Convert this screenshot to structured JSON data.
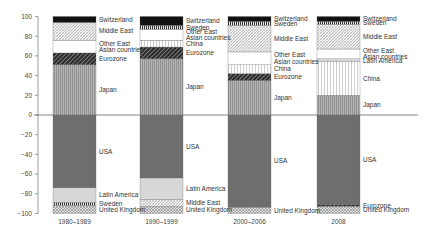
{
  "chart_data": {
    "type": "bar",
    "stacked": true,
    "title": "",
    "xlabel": "",
    "ylabel": "",
    "ylim": [
      -100,
      100
    ],
    "yticks": [
      100,
      80,
      60,
      40,
      20,
      0,
      -20,
      -40,
      -60,
      -80,
      -100
    ],
    "grid": false,
    "legend_position": "inline labels to right of each bar",
    "categories": [
      "1980–1989",
      "1990–1999",
      "2000–2006",
      "2008"
    ],
    "bars": [
      {
        "category": "1980–1989",
        "positive": [
          {
            "name": "Japan",
            "value": 51
          },
          {
            "name": "Eurozone",
            "value": 12
          },
          {
            "name": "Other East Asian countries",
            "value": 13
          },
          {
            "name": "Middle East",
            "value": 18
          },
          {
            "name": "Switzerland",
            "value": 6
          }
        ],
        "negative": [
          {
            "name": "USA",
            "value": -74
          },
          {
            "name": "Latin America",
            "value": -15
          },
          {
            "name": "Sweden",
            "value": -3
          },
          {
            "name": "United Kingdom",
            "value": -8
          }
        ]
      },
      {
        "category": "1990–1999",
        "positive": [
          {
            "name": "Japan",
            "value": 57
          },
          {
            "name": "Eurozone",
            "value": 12
          },
          {
            "name": "China",
            "value": 7
          },
          {
            "name": "Other East Asian countries",
            "value": 11
          },
          {
            "name": "Sweden",
            "value": 4
          },
          {
            "name": "Switzerland",
            "value": 9
          }
        ],
        "negative": [
          {
            "name": "USA",
            "value": -64
          },
          {
            "name": "Latin America",
            "value": -22
          },
          {
            "name": "Middle East",
            "value": -7
          },
          {
            "name": "United Kingdom",
            "value": -7
          }
        ]
      },
      {
        "category": "2000–2006",
        "positive": [
          {
            "name": "Japan",
            "value": 35
          },
          {
            "name": "Eurozone",
            "value": 7
          },
          {
            "name": "China",
            "value": 9
          },
          {
            "name": "Other East Asian countries",
            "value": 13
          },
          {
            "name": "Middle East",
            "value": 27
          },
          {
            "name": "Sweden",
            "value": 4
          },
          {
            "name": "Switzerland",
            "value": 5
          }
        ],
        "negative": [
          {
            "name": "USA",
            "value": -94
          },
          {
            "name": "United Kingdom",
            "value": -6
          }
        ]
      },
      {
        "category": "2008",
        "positive": [
          {
            "name": "Japan",
            "value": 20
          },
          {
            "name": "China",
            "value": 34
          },
          {
            "name": "Latin America",
            "value": 3
          },
          {
            "name": "Other East Asian countries",
            "value": 10
          },
          {
            "name": "Middle East",
            "value": 25
          },
          {
            "name": "Sweden",
            "value": 3
          },
          {
            "name": "Switzerland",
            "value": 5
          }
        ],
        "negative": [
          {
            "name": "USA",
            "value": -91
          },
          {
            "name": "Eurozone",
            "value": -2
          },
          {
            "name": "United Kingdom",
            "value": -7
          }
        ]
      }
    ],
    "labels": {
      "Japan": "Japan",
      "Eurozone": "Eurozone",
      "China": "China",
      "Other East Asian countries": [
        "Other East",
        "Asian countries"
      ],
      "Middle East": "Middle East",
      "Sweden": "Sweden",
      "Switzerland": "Switzerland",
      "USA": "USA",
      "Latin America": "Latin America",
      "United Kingdom": "United Kingdom"
    },
    "patterns": {
      "Switzerland": "solid-black",
      "Sweden": "dense-vertical-dark",
      "Middle East": "crosshatch-light",
      "Other East Asian countries": "white",
      "China": "vertical-light",
      "Eurozone": "diagonal-dark",
      "Japan": "vertical-grey",
      "USA": "solid-dark-grey",
      "Latin America": "light-grey",
      "United Kingdom": "crosshatch-grey"
    },
    "colors": {
      "axis": "#555555",
      "Switzerland": "#111111",
      "USA": "#6e6e6e",
      "Japan": "#a8a8a8",
      "Latin America": "#d8d8d8",
      "Other East Asian countries": "#ffffff"
    }
  }
}
